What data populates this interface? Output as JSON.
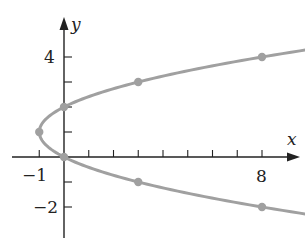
{
  "chart_data": {
    "type": "line",
    "title": "",
    "xlabel": "x",
    "ylabel": "y",
    "xlim": [
      -2,
      9
    ],
    "ylim": [
      -3,
      5
    ],
    "grid": false,
    "x_ticks": [
      -1,
      0,
      1,
      2,
      3,
      4,
      5,
      6,
      7,
      8
    ],
    "y_ticks": [
      -2,
      -1,
      1,
      2,
      3,
      4
    ],
    "x_tick_labels": [
      {
        "value": -1,
        "label": "−1"
      },
      {
        "value": 8,
        "label": "8"
      }
    ],
    "y_tick_labels": [
      {
        "value": 4,
        "label": "4"
      },
      {
        "value": -2,
        "label": "−2"
      }
    ],
    "series": [
      {
        "name": "x = y^2 - 2y",
        "color": "#a0a0a0",
        "curve": "parabola opening right",
        "y_range": [
          -2.3,
          4.3
        ],
        "points": [
          {
            "x": 8,
            "y": -2
          },
          {
            "x": 3,
            "y": -1
          },
          {
            "x": 0,
            "y": 0
          },
          {
            "x": -1,
            "y": 1
          },
          {
            "x": 0,
            "y": 2
          },
          {
            "x": 3,
            "y": 3
          },
          {
            "x": 8,
            "y": 4
          }
        ]
      }
    ],
    "axis_color": "#222222",
    "point_color": "#a0a0a0"
  },
  "labels": {
    "x_axis": "x",
    "y_axis": "y",
    "x_neg1": "−1",
    "x_8": "8",
    "y_4": "4",
    "y_neg2": "−2"
  }
}
